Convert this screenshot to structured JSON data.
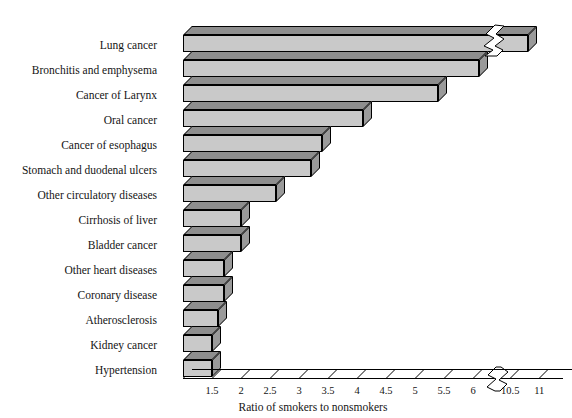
{
  "chart_data": {
    "type": "bar",
    "orientation": "horizontal",
    "title": "",
    "xlabel": "Ratio of smokers to nonsmokers",
    "ylabel": "",
    "categories": [
      "Lung cancer",
      "Bronchitis and emphysema",
      "Cancer of Larynx",
      "Oral cancer",
      "Cancer of esophagus",
      "Stomach and duodenal ulcers",
      "Other circulatory diseases",
      "Cirrhosis of liver",
      "Bladder cancer",
      "Other heart diseases",
      "Coronary disease",
      "Atherosclerosis",
      "Kidney cancer",
      "Hypertension"
    ],
    "values": [
      10.8,
      6.1,
      5.4,
      4.1,
      3.4,
      3.2,
      2.6,
      2.0,
      2.0,
      1.7,
      1.7,
      1.6,
      1.5,
      1.5
    ],
    "xticks": [
      "1.5",
      "2",
      "2.5",
      "3",
      "3.5",
      "4",
      "4.5",
      "5",
      "5.5",
      "6",
      "10.5",
      "11"
    ],
    "xtick_values": [
      1.5,
      2,
      2.5,
      3,
      3.5,
      4,
      4.5,
      5,
      5.5,
      6,
      10.5,
      11
    ],
    "xlim": [
      1,
      11
    ],
    "axis_break": {
      "from": 6.2,
      "to": 10.3,
      "present": true
    },
    "grid": false,
    "legend": false,
    "bar_style": "3d-block",
    "colors": {
      "bar_front": "#c9c9c9",
      "bar_top": "#8e8e8e",
      "bar_side": "#9a9a9a",
      "outline": "#000000",
      "background": "#ffffff",
      "text": "#141414"
    }
  }
}
